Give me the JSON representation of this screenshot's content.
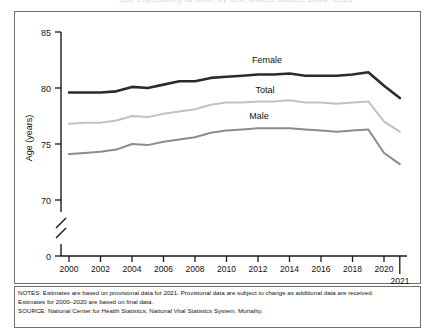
{
  "figure": {
    "top_partial_title": "Life expectancy at birth, by sex: United States, 2000–2021",
    "y_axis_title": "Age (years)",
    "y_ticks": [
      "85",
      "80",
      "75",
      "70",
      "0"
    ],
    "x_ticks": [
      "2000",
      "2002",
      "2004",
      "2006",
      "2008",
      "2010",
      "2012",
      "2014",
      "2016",
      "2018",
      "2020"
    ],
    "x_extra_tick_label": "2021",
    "series_labels": {
      "female": "Female",
      "total": "Total",
      "male": "Male"
    },
    "colors": {
      "female": "#2b2b2b",
      "total": "#c2c2c2",
      "male": "#8c8c8c",
      "axis": "#1a1a1a",
      "border": "#6f6f6f"
    }
  },
  "notes": {
    "line1": "NOTES: Estimates are based on provisional data for 2021. Provisional data are subject to change as additional data are received.",
    "line2": "Estimates for 2000–2020 are based on final data.",
    "line3": "SOURCE: National Center for Health Statistics, National Vital Statistics System, Mortality."
  },
  "chart_data": {
    "type": "line",
    "title": "Life expectancy at birth, by sex: United States, 2000–2021",
    "xlabel": "",
    "ylabel": "Age (years)",
    "ylim": [
      68.5,
      85
    ],
    "y_ticks": [
      70,
      75,
      80,
      85
    ],
    "y_axis_break": true,
    "y_break_note": "axis broken between 0 and 70",
    "grid": false,
    "legend": "inline labels on lines",
    "x": [
      2000,
      2001,
      2002,
      2003,
      2004,
      2005,
      2006,
      2007,
      2008,
      2009,
      2010,
      2011,
      2012,
      2013,
      2014,
      2015,
      2016,
      2017,
      2018,
      2019,
      2020,
      2021
    ],
    "series": [
      {
        "name": "Female",
        "color": "#2b2b2b",
        "values": [
          79.6,
          79.6,
          79.6,
          79.7,
          80.1,
          80.0,
          80.3,
          80.6,
          80.6,
          80.9,
          81.0,
          81.1,
          81.2,
          81.2,
          81.3,
          81.1,
          81.1,
          81.1,
          81.2,
          81.4,
          80.2,
          79.1
        ]
      },
      {
        "name": "Total",
        "color": "#c2c2c2",
        "values": [
          76.8,
          76.9,
          76.9,
          77.1,
          77.5,
          77.4,
          77.7,
          77.9,
          78.1,
          78.5,
          78.7,
          78.7,
          78.8,
          78.8,
          78.9,
          78.7,
          78.7,
          78.6,
          78.7,
          78.8,
          77.0,
          76.1
        ]
      },
      {
        "name": "Male",
        "color": "#8c8c8c",
        "values": [
          74.1,
          74.2,
          74.3,
          74.5,
          75.0,
          74.9,
          75.2,
          75.4,
          75.6,
          76.0,
          76.2,
          76.3,
          76.4,
          76.4,
          76.4,
          76.3,
          76.2,
          76.1,
          76.2,
          76.3,
          74.2,
          73.2
        ]
      }
    ],
    "annotations": [
      {
        "text": "Female",
        "x": 2011.3,
        "y": 82.3
      },
      {
        "text": "Total",
        "x": 2011.1,
        "y": 79.6
      },
      {
        "text": "Male",
        "x": 2010.6,
        "y": 77.4
      }
    ]
  }
}
